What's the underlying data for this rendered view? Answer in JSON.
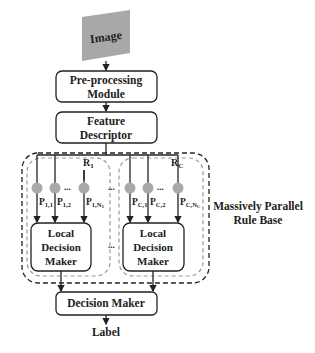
{
  "diagram": {
    "input": "Image",
    "preprocessing": [
      "Pre-processing",
      "Module"
    ],
    "feature": [
      "Feature",
      "Descriptor"
    ],
    "rule_base_label": [
      "Massively Parallel",
      "Rule Base"
    ],
    "rule_groups": [
      {
        "name": "R",
        "sub": "1",
        "predicates": [
          {
            "p": "P",
            "sub": "1,1"
          },
          {
            "p": "P",
            "sub": "1,2"
          },
          {
            "p": "P",
            "sub": "1,N"
          }
        ],
        "nsub": "1"
      },
      {
        "name": "R",
        "sub": "C",
        "predicates": [
          {
            "p": "P",
            "sub": "C,1"
          },
          {
            "p": "P",
            "sub": "C,2"
          },
          {
            "p": "P",
            "sub": "C,N"
          }
        ],
        "nsub": "C"
      }
    ],
    "local_decision": [
      "Local",
      "Decision",
      "Maker"
    ],
    "ellipsis": "...",
    "decision_maker": "Decision Maker",
    "output": "Label"
  },
  "colors": {
    "stroke": "#222222",
    "image_fill": "#a8a8a8",
    "node_fill": "#a9a9a9",
    "dash_gray": "#999999"
  }
}
